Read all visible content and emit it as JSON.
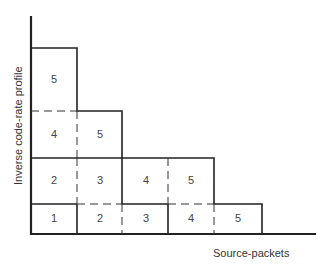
{
  "diagram": {
    "x_axis_label": "Source-packets",
    "y_axis_label": "Inverse code-rate profile",
    "cells": [
      {
        "row": 1,
        "col": 1,
        "label": "1",
        "x": 54,
        "y": 219
      },
      {
        "row": 1,
        "col": 2,
        "label": "2",
        "x": 100,
        "y": 219
      },
      {
        "row": 1,
        "col": 3,
        "label": "3",
        "x": 146,
        "y": 219
      },
      {
        "row": 1,
        "col": 4,
        "label": "4",
        "x": 191,
        "y": 219
      },
      {
        "row": 1,
        "col": 5,
        "label": "5",
        "x": 238,
        "y": 219
      },
      {
        "row": 2,
        "col": 1,
        "label": "2",
        "x": 54,
        "y": 181
      },
      {
        "row": 2,
        "col": 2,
        "label": "3",
        "x": 100,
        "y": 181
      },
      {
        "row": 2,
        "col": 3,
        "label": "4",
        "x": 146,
        "y": 181
      },
      {
        "row": 2,
        "col": 4,
        "label": "5",
        "x": 191,
        "y": 181
      },
      {
        "row": 3,
        "col": 1,
        "label": "4",
        "x": 54,
        "y": 135
      },
      {
        "row": 3,
        "col": 2,
        "label": "5",
        "x": 100,
        "y": 135
      },
      {
        "row": 4,
        "col": 1,
        "label": "5",
        "x": 54,
        "y": 80
      }
    ]
  }
}
